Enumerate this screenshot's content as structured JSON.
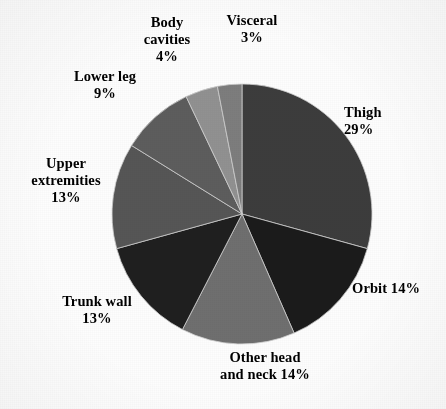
{
  "figure": {
    "background_color": "#fdfdfd",
    "text_color": "#000000"
  },
  "chart_data": {
    "type": "pie",
    "title": "",
    "xlabel": "",
    "ylabel": "",
    "units": "percent",
    "total": 99,
    "start_angle_deg": 0,
    "direction": "clockwise",
    "legend": "none (direct slice labels)",
    "grid": false,
    "categories": [
      "Thigh",
      "Orbit",
      "Other head and neck",
      "Trunk wall",
      "Upper extremities",
      "Lower leg",
      "Body cavities",
      "Visceral"
    ],
    "values": [
      29,
      14,
      14,
      13,
      13,
      9,
      4,
      3
    ],
    "colors": [
      "#3c3c3c",
      "#1b1b1b",
      "#6f6f6f",
      "#1f1f1f",
      "#565656",
      "#5d5d5d",
      "#919191",
      "#7d7d7d"
    ],
    "slices": [
      {
        "name": "Thigh",
        "value": 29,
        "label": "Thigh\n29%",
        "color": "#3c3c3c"
      },
      {
        "name": "Orbit",
        "value": 14,
        "label": "Orbit  14%",
        "color": "#1b1b1b"
      },
      {
        "name": "Other head and neck",
        "value": 14,
        "label": "Other head\nand neck  14%",
        "color": "#6f6f6f"
      },
      {
        "name": "Trunk wall",
        "value": 13,
        "label": "Trunk wall\n13%",
        "color": "#1f1f1f"
      },
      {
        "name": "Upper extremities",
        "value": 13,
        "label": "Upper\nextremities\n13%",
        "color": "#565656"
      },
      {
        "name": "Lower leg",
        "value": 9,
        "label": "Lower leg\n9%",
        "color": "#5d5d5d"
      },
      {
        "name": "Body cavities",
        "value": 4,
        "label": "Body\ncavities\n4%",
        "color": "#919191"
      },
      {
        "name": "Visceral",
        "value": 3,
        "label": "Visceral\n3%",
        "color": "#7d7d7d"
      }
    ]
  },
  "labels": {
    "thigh": "Thigh\n29%",
    "orbit": "Orbit  14%",
    "other_head_and_neck": "Other head\nand neck  14%",
    "trunk_wall": "Trunk wall\n13%",
    "upper_extremities": "Upper\nextremities\n13%",
    "lower_leg": "Lower leg\n9%",
    "body_cavities": "Body\ncavities\n4%",
    "visceral": "Visceral\n3%"
  }
}
